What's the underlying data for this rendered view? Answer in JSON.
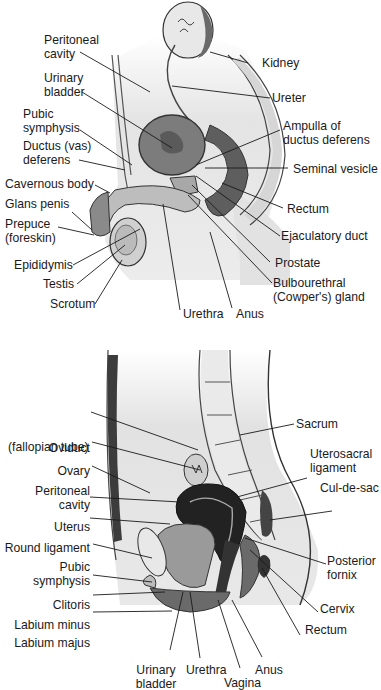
{
  "male_figure": {
    "labels": {
      "peritoneal_cavity": [
        "Peritoneal",
        "cavity"
      ],
      "urinary_bladder": [
        "Urinary",
        "bladder"
      ],
      "pubic_symphysis": [
        "Pubic",
        "symphysis"
      ],
      "ductus_deferens": [
        "Ductus (vas)",
        "deferens"
      ],
      "cavernous_body": "Cavernous body",
      "glans_penis": "Glans penis",
      "prepuce": [
        "Prepuce",
        "(foreskin)"
      ],
      "epididymis": "Epididymis",
      "testis": "Testis",
      "scrotum": "Scrotum",
      "urethra": "Urethra",
      "anus": "Anus",
      "kidney": "Kidney",
      "ureter": "Ureter",
      "ampulla": [
        "Ampulla of",
        "ductus deferens"
      ],
      "seminal_vesicle": "Seminal vesicle",
      "rectum": "Rectum",
      "ejaculatory_duct": "Ejaculatory duct",
      "prostate": "Prostate",
      "bulbourethral_gland": [
        "Bulbourethral",
        "(Cowper's) gland"
      ]
    }
  },
  "female_figure": {
    "labels": {
      "oviduct": [
        "Oviduct",
        "(fallopian tube)"
      ],
      "ovary": "Ovary",
      "peritoneal_cavity": [
        "Peritoneal",
        "cavity"
      ],
      "uterus": "Uterus",
      "round_ligament": "Round ligament",
      "pubic_symphysis": [
        "Pubic",
        "symphysis"
      ],
      "clitoris": "Clitoris",
      "labium_minus": "Labium minus",
      "labium_majus": "Labium majus",
      "urinary_bladder": [
        "Urinary",
        "bladder"
      ],
      "urethra": "Urethra",
      "vagina": "Vagina",
      "anus": "Anus",
      "rectum": "Rectum",
      "cervix": "Cervix",
      "posterior_fornix": [
        "Posterior",
        "fornix"
      ],
      "cul_de_sac": "Cul-de-sac",
      "uterosacral_ligament": [
        "Uterosacral",
        "ligament"
      ],
      "sacrum": "Sacrum"
    }
  }
}
